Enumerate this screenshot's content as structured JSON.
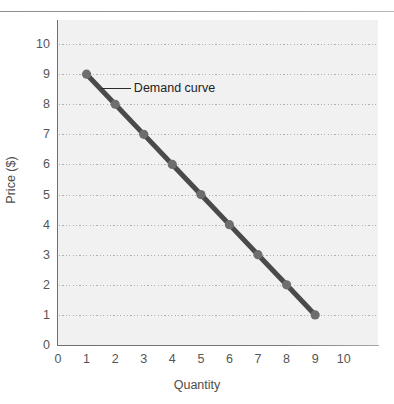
{
  "figure": {
    "background_color": "#ffffff",
    "panel_color": "#f1f1f1",
    "rule_color": "#8d8d8d"
  },
  "annotation": {
    "text": "Demand curve"
  },
  "chart_data": {
    "type": "line",
    "title": "",
    "xlabel": "Quantity",
    "ylabel": "Price ($)",
    "xlim": [
      0,
      11.2
    ],
    "ylim": [
      0,
      10.8
    ],
    "grid": true,
    "grid_axis": "y",
    "grid_style": "dotted",
    "legend": "none",
    "xticks": [
      0,
      1,
      2,
      3,
      4,
      5,
      6,
      7,
      8,
      9,
      10
    ],
    "xtick_labels": [
      "0",
      "1",
      "2",
      "3",
      "4",
      "5",
      "6",
      "7",
      "8",
      "9",
      "10"
    ],
    "yticks": [
      0,
      1,
      2,
      3,
      4,
      5,
      6,
      7,
      8,
      9,
      10
    ],
    "ytick_labels": [
      "0",
      "1",
      "2",
      "3",
      "4",
      "5",
      "6",
      "7",
      "8",
      "9",
      "10"
    ],
    "gridline_values": [
      1,
      2,
      3,
      4,
      5,
      6,
      7,
      8,
      9,
      10
    ],
    "series": [
      {
        "name": "Demand curve",
        "line_color": "#4a4a4a",
        "marker_color": "#6e6e6e",
        "marker": "circle",
        "x": [
          1,
          2,
          3,
          4,
          5,
          6,
          7,
          8,
          9
        ],
        "y": [
          9,
          8,
          7,
          6,
          5,
          4,
          3,
          2,
          1
        ]
      }
    ],
    "annotations": [
      {
        "text": "Demand curve",
        "anchor_x": 1.5,
        "anchor_y": 8.55,
        "label_x": 2.55,
        "label_y": 8.55
      }
    ]
  }
}
